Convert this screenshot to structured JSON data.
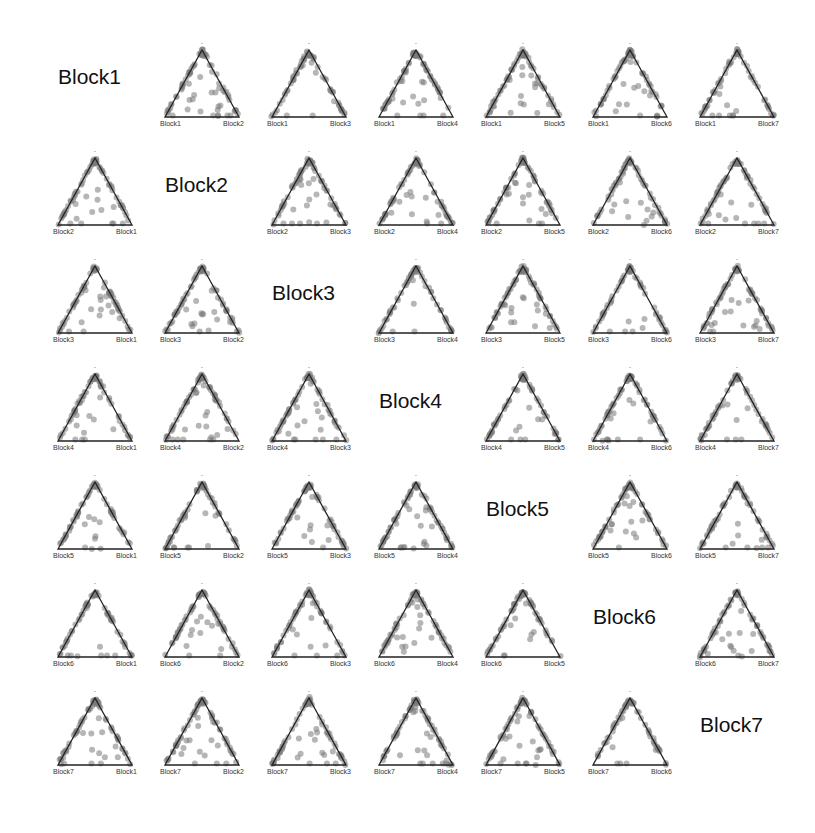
{
  "chart_data": {
    "type": "scatter",
    "subtype": "ternary-matrix",
    "title": "",
    "blocks": [
      "Block1",
      "Block2",
      "Block3",
      "Block4",
      "Block5",
      "Block6",
      "Block7"
    ],
    "layout": {
      "rows": 7,
      "cols": 7,
      "diagonal": "block label",
      "off_diagonal": "ternary plot (row block, column block, remainder at apex)"
    },
    "apex_label": "·",
    "panels": [
      {
        "row": 1,
        "col": 2,
        "left": "Block1",
        "right": "Block2"
      },
      {
        "row": 1,
        "col": 3,
        "left": "Block1",
        "right": "Block3"
      },
      {
        "row": 1,
        "col": 4,
        "left": "Block1",
        "right": "Block4"
      },
      {
        "row": 1,
        "col": 5,
        "left": "Block1",
        "right": "Block5"
      },
      {
        "row": 1,
        "col": 6,
        "left": "Block1",
        "right": "Block6"
      },
      {
        "row": 1,
        "col": 7,
        "left": "Block1",
        "right": "Block7"
      },
      {
        "row": 2,
        "col": 1,
        "left": "Block2",
        "right": "Block1"
      },
      {
        "row": 2,
        "col": 3,
        "left": "Block2",
        "right": "Block3"
      },
      {
        "row": 2,
        "col": 4,
        "left": "Block2",
        "right": "Block4"
      },
      {
        "row": 2,
        "col": 5,
        "left": "Block2",
        "right": "Block5"
      },
      {
        "row": 2,
        "col": 6,
        "left": "Block2",
        "right": "Block6"
      },
      {
        "row": 2,
        "col": 7,
        "left": "Block2",
        "right": "Block7"
      },
      {
        "row": 3,
        "col": 1,
        "left": "Block3",
        "right": "Block1"
      },
      {
        "row": 3,
        "col": 2,
        "left": "Block3",
        "right": "Block2"
      },
      {
        "row": 3,
        "col": 4,
        "left": "Block3",
        "right": "Block4"
      },
      {
        "row": 3,
        "col": 5,
        "left": "Block3",
        "right": "Block5"
      },
      {
        "row": 3,
        "col": 6,
        "left": "Block3",
        "right": "Block6"
      },
      {
        "row": 3,
        "col": 7,
        "left": "Block3",
        "right": "Block7"
      },
      {
        "row": 4,
        "col": 1,
        "left": "Block4",
        "right": "Block1"
      },
      {
        "row": 4,
        "col": 2,
        "left": "Block4",
        "right": "Block2"
      },
      {
        "row": 4,
        "col": 3,
        "left": "Block4",
        "right": "Block3"
      },
      {
        "row": 4,
        "col": 5,
        "left": "Block4",
        "right": "Block5"
      },
      {
        "row": 4,
        "col": 6,
        "left": "Block4",
        "right": "Block6"
      },
      {
        "row": 4,
        "col": 7,
        "left": "Block4",
        "right": "Block7"
      },
      {
        "row": 5,
        "col": 1,
        "left": "Block5",
        "right": "Block1"
      },
      {
        "row": 5,
        "col": 2,
        "left": "Block5",
        "right": "Block2"
      },
      {
        "row": 5,
        "col": 3,
        "left": "Block5",
        "right": "Block3"
      },
      {
        "row": 5,
        "col": 4,
        "left": "Block5",
        "right": "Block4"
      },
      {
        "row": 5,
        "col": 6,
        "left": "Block5",
        "right": "Block6"
      },
      {
        "row": 5,
        "col": 7,
        "left": "Block5",
        "right": "Block7"
      },
      {
        "row": 6,
        "col": 1,
        "left": "Block6",
        "right": "Block1"
      },
      {
        "row": 6,
        "col": 2,
        "left": "Block6",
        "right": "Block2"
      },
      {
        "row": 6,
        "col": 3,
        "left": "Block6",
        "right": "Block3"
      },
      {
        "row": 6,
        "col": 4,
        "left": "Block6",
        "right": "Block4"
      },
      {
        "row": 6,
        "col": 5,
        "left": "Block6",
        "right": "Block5"
      },
      {
        "row": 6,
        "col": 7,
        "left": "Block6",
        "right": "Block7"
      },
      {
        "row": 7,
        "col": 1,
        "left": "Block7",
        "right": "Block1"
      },
      {
        "row": 7,
        "col": 2,
        "left": "Block7",
        "right": "Block2"
      },
      {
        "row": 7,
        "col": 3,
        "left": "Block7",
        "right": "Block3"
      },
      {
        "row": 7,
        "col": 4,
        "left": "Block7",
        "right": "Block4"
      },
      {
        "row": 7,
        "col": 5,
        "left": "Block7",
        "right": "Block5"
      },
      {
        "row": 7,
        "col": 6,
        "left": "Block7",
        "right": "Block6"
      }
    ],
    "style": {
      "point_color": "#7a7a7a",
      "point_opacity": 0.55,
      "edge_color": "#222222",
      "background": "#ffffff"
    },
    "grid": false,
    "legend": "none"
  }
}
